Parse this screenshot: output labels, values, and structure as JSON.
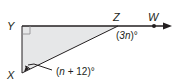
{
  "diagram": {
    "type": "geometry-triangle-exterior-angle",
    "vertices": {
      "Y": "Y",
      "X": "X",
      "Z": "Z",
      "W": "W"
    },
    "right_angle_at": "Y",
    "angles": {
      "exterior_at_Z": {
        "open": "(",
        "var": "3n",
        "close": ")°"
      },
      "at_X": {
        "open": "(",
        "var": "n",
        "rest": " + 12)°"
      }
    },
    "colors": {
      "triangle_fill": "#e6e7e8",
      "stroke": "#231f20"
    }
  }
}
